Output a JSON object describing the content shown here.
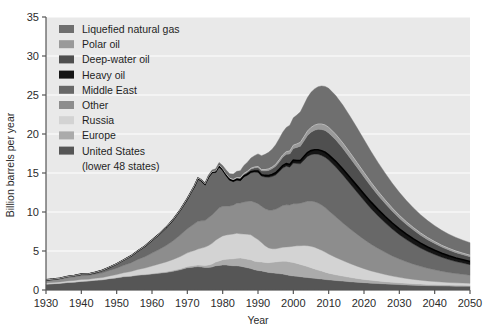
{
  "chart_data": {
    "type": "area",
    "title": "",
    "xlabel": "Year",
    "ylabel": "Billion barrels per year",
    "xlim": [
      1930,
      2050
    ],
    "ylim": [
      0,
      35
    ],
    "ytick_labels": [
      "0",
      "5",
      "10",
      "15",
      "20",
      "25",
      "30",
      "35"
    ],
    "yticks": [
      0,
      5,
      10,
      15,
      20,
      25,
      30,
      35
    ],
    "xtick_labels": [
      "1930",
      "1940",
      "1950",
      "1960",
      "1970",
      "1980",
      "1990",
      "2000",
      "2010",
      "2020",
      "2030",
      "2040",
      "2050"
    ],
    "xticks": [
      1930,
      1940,
      1950,
      1960,
      1970,
      1980,
      1990,
      2000,
      2010,
      2020,
      2030,
      2040,
      2050
    ],
    "grid": true,
    "grid_color": "#ffffff",
    "plot_background": "#e9e9e9",
    "legend_position": "upper-left",
    "stack_order_bottom_to_top": [
      "United  States\n(lower 48 states)",
      "Europe",
      "Russia",
      "Other",
      "Middle East",
      "Heavy oil",
      "Deep-water oil",
      "Polar oil",
      "Liquefied natural gas"
    ],
    "legend": [
      {
        "label": "Liquefied natural gas",
        "color": "#6f6f6f"
      },
      {
        "label": "Polar oil",
        "color": "#9a9a9a"
      },
      {
        "label": "Deep-water oil",
        "color": "#4f4f4f"
      },
      {
        "label": "Heavy oil",
        "color": "#151515"
      },
      {
        "label": "Middle East",
        "color": "#686868"
      },
      {
        "label": "Other",
        "color": "#8d8d8d"
      },
      {
        "label": "Russia",
        "color": "#d3d3d3"
      },
      {
        "label": "Europe",
        "color": "#ababab"
      },
      {
        "label": "United  States",
        "color": "#565656"
      }
    ],
    "legend_extra_line": "(lower 48 states)",
    "x": [
      1930,
      1932,
      1934,
      1936,
      1938,
      1940,
      1942,
      1944,
      1946,
      1948,
      1950,
      1952,
      1954,
      1956,
      1958,
      1960,
      1962,
      1964,
      1966,
      1968,
      1970,
      1971,
      1972,
      1973,
      1974,
      1975,
      1976,
      1977,
      1978,
      1979,
      1980,
      1981,
      1982,
      1983,
      1984,
      1985,
      1986,
      1987,
      1988,
      1989,
      1990,
      1991,
      1992,
      1993,
      1994,
      1995,
      1996,
      1997,
      1998,
      1999,
      2000,
      2001,
      2002,
      2003,
      2004,
      2005,
      2006,
      2007,
      2008,
      2009,
      2010,
      2012,
      2014,
      2016,
      2018,
      2020,
      2022,
      2024,
      2026,
      2028,
      2030,
      2032,
      2034,
      2036,
      2038,
      2040,
      2042,
      2044,
      2046,
      2048,
      2050
    ],
    "series": [
      {
        "name": "United  States (lower 48 states)",
        "color": "#565656",
        "values": [
          0.75,
          0.8,
          0.85,
          0.95,
          1.0,
          1.1,
          1.15,
          1.25,
          1.3,
          1.45,
          1.55,
          1.7,
          1.75,
          1.9,
          1.95,
          2.05,
          2.15,
          2.25,
          2.4,
          2.6,
          2.85,
          2.9,
          2.95,
          3.0,
          2.95,
          2.9,
          2.9,
          2.95,
          3.1,
          3.15,
          3.2,
          3.2,
          3.15,
          3.1,
          3.1,
          3.05,
          2.95,
          2.85,
          2.75,
          2.6,
          2.5,
          2.45,
          2.35,
          2.25,
          2.2,
          2.15,
          2.1,
          2.05,
          1.95,
          1.85,
          1.8,
          1.75,
          1.7,
          1.65,
          1.6,
          1.55,
          1.5,
          1.45,
          1.4,
          1.35,
          1.3,
          1.22,
          1.14,
          1.06,
          1.0,
          0.94,
          0.88,
          0.83,
          0.78,
          0.73,
          0.69,
          0.65,
          0.62,
          0.59,
          0.56,
          0.54,
          0.52,
          0.5,
          0.49,
          0.48,
          0.47
        ]
      },
      {
        "name": "Europe",
        "color": "#ababab",
        "values": [
          0.02,
          0.02,
          0.02,
          0.03,
          0.03,
          0.03,
          0.03,
          0.03,
          0.04,
          0.04,
          0.05,
          0.05,
          0.06,
          0.06,
          0.07,
          0.08,
          0.09,
          0.1,
          0.12,
          0.14,
          0.16,
          0.17,
          0.18,
          0.2,
          0.22,
          0.25,
          0.3,
          0.38,
          0.48,
          0.58,
          0.68,
          0.75,
          0.82,
          0.9,
          0.98,
          1.05,
          1.08,
          1.1,
          1.12,
          1.1,
          1.12,
          1.14,
          1.18,
          1.25,
          1.35,
          1.45,
          1.55,
          1.65,
          1.72,
          1.75,
          1.72,
          1.66,
          1.58,
          1.5,
          1.4,
          1.3,
          1.2,
          1.1,
          1.02,
          0.94,
          0.86,
          0.74,
          0.64,
          0.56,
          0.48,
          0.42,
          0.37,
          0.33,
          0.29,
          0.26,
          0.23,
          0.21,
          0.19,
          0.17,
          0.16,
          0.15,
          0.14,
          0.13,
          0.12,
          0.12,
          0.11
        ]
      },
      {
        "name": "Russia",
        "color": "#d3d3d3",
        "values": [
          0.13,
          0.14,
          0.16,
          0.18,
          0.2,
          0.22,
          0.2,
          0.22,
          0.26,
          0.32,
          0.38,
          0.46,
          0.56,
          0.68,
          0.8,
          0.95,
          1.1,
          1.25,
          1.4,
          1.55,
          1.75,
          1.85,
          1.95,
          2.05,
          2.2,
          2.35,
          2.5,
          2.65,
          2.8,
          2.95,
          3.05,
          3.1,
          3.15,
          3.18,
          3.2,
          3.1,
          3.15,
          3.2,
          3.2,
          3.05,
          2.85,
          2.5,
          2.15,
          1.9,
          1.75,
          1.7,
          1.72,
          1.78,
          1.85,
          1.95,
          2.1,
          2.25,
          2.4,
          2.55,
          2.68,
          2.75,
          2.78,
          2.75,
          2.68,
          2.58,
          2.45,
          2.22,
          2.0,
          1.78,
          1.58,
          1.38,
          1.2,
          1.05,
          0.92,
          0.8,
          0.7,
          0.62,
          0.55,
          0.49,
          0.44,
          0.4,
          0.36,
          0.33,
          0.31,
          0.29,
          0.27
        ]
      },
      {
        "name": "Other",
        "color": "#8d8d8d",
        "values": [
          0.3,
          0.32,
          0.35,
          0.4,
          0.44,
          0.48,
          0.48,
          0.52,
          0.6,
          0.7,
          0.82,
          0.95,
          1.1,
          1.28,
          1.45,
          1.65,
          1.85,
          2.1,
          2.4,
          2.75,
          3.1,
          3.25,
          3.4,
          3.55,
          3.5,
          3.4,
          3.55,
          3.65,
          3.7,
          3.85,
          3.8,
          3.7,
          3.65,
          3.7,
          3.85,
          3.95,
          4.1,
          4.2,
          4.35,
          4.5,
          4.6,
          4.65,
          4.75,
          4.85,
          4.95,
          5.05,
          5.2,
          5.35,
          5.4,
          5.35,
          5.45,
          5.4,
          5.45,
          5.55,
          5.7,
          5.8,
          5.85,
          5.85,
          5.8,
          5.7,
          5.55,
          5.2,
          4.82,
          4.45,
          4.1,
          3.75,
          3.42,
          3.12,
          2.84,
          2.58,
          2.35,
          2.14,
          1.95,
          1.78,
          1.63,
          1.5,
          1.38,
          1.28,
          1.19,
          1.12,
          1.05
        ]
      },
      {
        "name": "Middle East",
        "color": "#686868",
        "values": [
          0.1,
          0.11,
          0.13,
          0.16,
          0.18,
          0.2,
          0.2,
          0.24,
          0.32,
          0.42,
          0.55,
          0.7,
          0.88,
          1.1,
          1.35,
          1.65,
          1.95,
          2.3,
          2.7,
          3.2,
          3.8,
          4.3,
          4.8,
          5.45,
          5.1,
          4.6,
          5.2,
          5.4,
          5.0,
          5.3,
          4.6,
          3.9,
          3.3,
          3.0,
          2.95,
          2.85,
          3.2,
          3.35,
          3.6,
          3.85,
          4.0,
          3.85,
          4.05,
          4.2,
          4.3,
          4.4,
          4.6,
          4.8,
          4.95,
          4.85,
          5.2,
          5.15,
          5.05,
          5.4,
          5.75,
          5.95,
          6.1,
          6.25,
          6.35,
          6.45,
          6.5,
          6.4,
          6.15,
          5.8,
          5.4,
          4.98,
          4.55,
          4.15,
          3.78,
          3.44,
          3.12,
          2.84,
          2.58,
          2.35,
          2.14,
          1.96,
          1.8,
          1.66,
          1.54,
          1.44,
          1.35
        ]
      },
      {
        "name": "Heavy oil",
        "color": "#151515",
        "values": [
          0.0,
          0.0,
          0.0,
          0.0,
          0.0,
          0.0,
          0.0,
          0.0,
          0.0,
          0.0,
          0.0,
          0.0,
          0.0,
          0.0,
          0.01,
          0.01,
          0.01,
          0.02,
          0.02,
          0.03,
          0.04,
          0.04,
          0.05,
          0.05,
          0.05,
          0.06,
          0.06,
          0.07,
          0.07,
          0.08,
          0.08,
          0.09,
          0.09,
          0.1,
          0.11,
          0.12,
          0.13,
          0.14,
          0.15,
          0.16,
          0.18,
          0.19,
          0.21,
          0.23,
          0.25,
          0.27,
          0.29,
          0.31,
          0.33,
          0.35,
          0.38,
          0.4,
          0.43,
          0.46,
          0.49,
          0.52,
          0.55,
          0.58,
          0.61,
          0.64,
          0.67,
          0.72,
          0.76,
          0.8,
          0.82,
          0.84,
          0.84,
          0.83,
          0.81,
          0.78,
          0.75,
          0.71,
          0.67,
          0.63,
          0.59,
          0.55,
          0.51,
          0.48,
          0.45,
          0.42,
          0.4
        ]
      },
      {
        "name": "Deep-water oil",
        "color": "#4f4f4f",
        "values": [
          0.0,
          0.0,
          0.0,
          0.0,
          0.0,
          0.0,
          0.0,
          0.0,
          0.0,
          0.0,
          0.0,
          0.0,
          0.0,
          0.0,
          0.0,
          0.0,
          0.0,
          0.0,
          0.01,
          0.01,
          0.02,
          0.02,
          0.03,
          0.03,
          0.04,
          0.04,
          0.05,
          0.06,
          0.07,
          0.08,
          0.09,
          0.1,
          0.12,
          0.14,
          0.17,
          0.2,
          0.24,
          0.28,
          0.33,
          0.38,
          0.44,
          0.5,
          0.57,
          0.65,
          0.74,
          0.84,
          0.95,
          1.07,
          1.2,
          1.34,
          1.5,
          1.66,
          1.83,
          2.0,
          2.18,
          2.35,
          2.5,
          2.62,
          2.72,
          2.78,
          2.8,
          2.76,
          2.66,
          2.52,
          2.36,
          2.18,
          2.0,
          1.82,
          1.66,
          1.5,
          1.36,
          1.23,
          1.12,
          1.02,
          0.93,
          0.86,
          0.79,
          0.74,
          0.69,
          0.65,
          0.62
        ]
      },
      {
        "name": "Polar oil",
        "color": "#9a9a9a",
        "values": [
          0.0,
          0.0,
          0.0,
          0.0,
          0.0,
          0.0,
          0.0,
          0.0,
          0.0,
          0.0,
          0.0,
          0.0,
          0.0,
          0.0,
          0.0,
          0.0,
          0.0,
          0.0,
          0.0,
          0.0,
          0.0,
          0.0,
          0.0,
          0.01,
          0.01,
          0.01,
          0.02,
          0.02,
          0.03,
          0.03,
          0.04,
          0.04,
          0.05,
          0.06,
          0.07,
          0.08,
          0.09,
          0.1,
          0.11,
          0.13,
          0.14,
          0.16,
          0.18,
          0.2,
          0.22,
          0.25,
          0.28,
          0.31,
          0.34,
          0.38,
          0.42,
          0.46,
          0.5,
          0.54,
          0.58,
          0.62,
          0.65,
          0.68,
          0.7,
          0.71,
          0.72,
          0.71,
          0.69,
          0.66,
          0.62,
          0.58,
          0.54,
          0.5,
          0.46,
          0.42,
          0.38,
          0.35,
          0.32,
          0.29,
          0.27,
          0.25,
          0.23,
          0.22,
          0.21,
          0.2,
          0.19
        ]
      },
      {
        "name": "Liquefied natural gas",
        "color": "#6f6f6f",
        "values": [
          0.0,
          0.0,
          0.0,
          0.0,
          0.0,
          0.0,
          0.0,
          0.0,
          0.0,
          0.0,
          0.0,
          0.0,
          0.0,
          0.0,
          0.0,
          0.0,
          0.01,
          0.01,
          0.02,
          0.03,
          0.05,
          0.06,
          0.08,
          0.1,
          0.12,
          0.14,
          0.18,
          0.22,
          0.28,
          0.34,
          0.42,
          0.5,
          0.58,
          0.68,
          0.78,
          0.9,
          1.02,
          1.15,
          1.3,
          1.45,
          1.62,
          1.78,
          1.95,
          2.12,
          2.3,
          2.5,
          2.7,
          2.9,
          3.1,
          3.3,
          3.5,
          3.7,
          3.9,
          4.1,
          4.3,
          4.5,
          4.65,
          4.78,
          4.88,
          4.95,
          5.0,
          4.96,
          4.85,
          4.68,
          4.46,
          4.22,
          3.96,
          3.7,
          3.44,
          3.18,
          2.94,
          2.72,
          2.52,
          2.34,
          2.18,
          2.04,
          1.92,
          1.82,
          1.74,
          1.67,
          1.61
        ]
      }
    ],
    "outline_after_series": "Heavy oil",
    "outline_color": "#000000"
  },
  "axis": {
    "ylabel": "Billion barrels per year",
    "xlabel": "Year"
  }
}
